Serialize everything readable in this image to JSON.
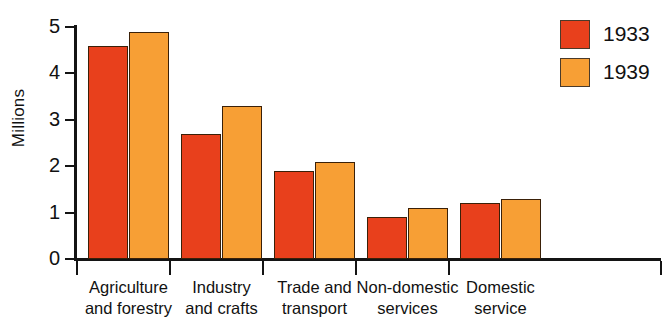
{
  "chart_data": {
    "type": "bar",
    "title": "",
    "xlabel": "",
    "ylabel": "Millions",
    "ylim": [
      0,
      5
    ],
    "yticks": [
      0,
      1,
      2,
      3,
      4,
      5
    ],
    "ytick_labels": [
      "0",
      "1",
      "2",
      "3",
      "4",
      "5"
    ],
    "grid": false,
    "legend_position": "top-right",
    "categories": [
      "Agriculture and forestry",
      "Industry and crafts",
      "Trade and transport",
      "Non-domestic services",
      "Domestic service"
    ],
    "category_lines": [
      [
        "Agriculture",
        "and forestry"
      ],
      [
        "Industry",
        "and crafts"
      ],
      [
        "Trade and",
        "transport"
      ],
      [
        "Non-domestic",
        "services"
      ],
      [
        "Domestic",
        "service"
      ]
    ],
    "series": [
      {
        "name": "1933",
        "color": "#E8401C",
        "values": [
          4.6,
          2.7,
          1.9,
          0.9,
          1.2
        ]
      },
      {
        "name": "1939",
        "color": "#F79F35",
        "values": [
          4.9,
          3.3,
          2.1,
          1.1,
          1.3
        ]
      }
    ]
  },
  "legend": {
    "items": [
      {
        "label": "1933",
        "color": "#E8401C"
      },
      {
        "label": "1939",
        "color": "#F79F35"
      }
    ]
  },
  "axis": {
    "y_title": "Millions"
  }
}
